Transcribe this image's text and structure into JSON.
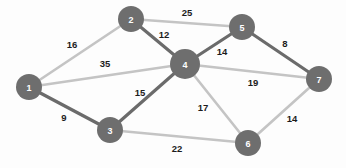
{
  "figure": {
    "kind": "weighted-undirected-graph",
    "background_color": "#fdfdfd",
    "node_fill_color": "#6e6e6e",
    "node_text_color": "#ffffff",
    "edge_dark_color": "#6b6b6b",
    "edge_light_color": "#c4c4c4",
    "weight_text_color": "#1c1c1c"
  },
  "chart_data": {
    "type": "graph",
    "title": "",
    "directed": false,
    "weighted": true,
    "node_count": 7,
    "edge_count": 12,
    "nodes": [
      {
        "id": "1",
        "label": "1",
        "x": 29,
        "y": 87,
        "r": 13
      },
      {
        "id": "2",
        "label": "2",
        "x": 131,
        "y": 19,
        "r": 13
      },
      {
        "id": "3",
        "label": "3",
        "x": 110,
        "y": 130,
        "r": 13
      },
      {
        "id": "4",
        "label": "4",
        "x": 185,
        "y": 64,
        "r": 15
      },
      {
        "id": "5",
        "label": "5",
        "x": 242,
        "y": 27,
        "r": 13
      },
      {
        "id": "6",
        "label": "6",
        "x": 248,
        "y": 143,
        "r": 13
      },
      {
        "id": "7",
        "label": "7",
        "x": 319,
        "y": 79,
        "r": 13
      }
    ],
    "edges": [
      {
        "source": "1",
        "target": "2",
        "weight": 16,
        "label": "16",
        "lx": 72,
        "ly": 44,
        "style": "light"
      },
      {
        "source": "1",
        "target": "4",
        "weight": 35,
        "label": "35",
        "lx": 105,
        "ly": 63,
        "style": "light"
      },
      {
        "source": "1",
        "target": "3",
        "weight": 9,
        "label": "9",
        "lx": 64,
        "ly": 117,
        "style": "dark"
      },
      {
        "source": "2",
        "target": "5",
        "weight": 25,
        "label": "25",
        "lx": 187,
        "ly": 12,
        "style": "light"
      },
      {
        "source": "2",
        "target": "4",
        "weight": 12,
        "label": "12",
        "lx": 164,
        "ly": 34,
        "style": "dark"
      },
      {
        "source": "4",
        "target": "5",
        "weight": 14,
        "label": "14",
        "lx": 222,
        "ly": 51,
        "style": "dark"
      },
      {
        "source": "5",
        "target": "7",
        "weight": 8,
        "label": "8",
        "lx": 285,
        "ly": 43,
        "style": "dark"
      },
      {
        "source": "4",
        "target": "7",
        "weight": 19,
        "label": "19",
        "lx": 253,
        "ly": 82,
        "style": "light"
      },
      {
        "source": "3",
        "target": "4",
        "weight": 15,
        "label": "15",
        "lx": 140,
        "ly": 92,
        "style": "dark"
      },
      {
        "source": "4",
        "target": "6",
        "weight": 17,
        "label": "17",
        "lx": 203,
        "ly": 107,
        "style": "light"
      },
      {
        "source": "3",
        "target": "6",
        "weight": 22,
        "label": "22",
        "lx": 177,
        "ly": 148,
        "style": "light"
      },
      {
        "source": "6",
        "target": "7",
        "weight": 14,
        "label": "14",
        "lx": 292,
        "ly": 118,
        "style": "light"
      }
    ],
    "edge_list_readable": [
      "1 - 2 : 16",
      "1 - 4 : 35",
      "1 - 3 : 9",
      "2 - 5 : 25",
      "2 - 4 : 12",
      "4 - 5 : 14",
      "5 - 7 : 8",
      "4 - 7 : 19",
      "3 - 4 : 15",
      "4 - 6 : 17",
      "3 - 6 : 22",
      "6 - 7 : 14"
    ]
  }
}
